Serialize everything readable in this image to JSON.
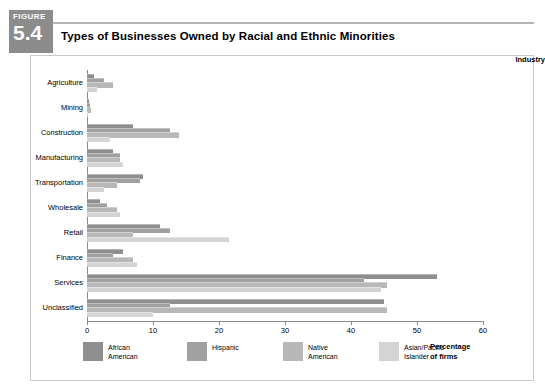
{
  "figure": {
    "word": "FIGURE",
    "number": "5.4",
    "badge_color": "#8c8c8c"
  },
  "title": "Types of Businesses Owned by Racial and Ethnic Minorities",
  "axis_header": "Industry",
  "xaxis_title_line1": "Percentage",
  "xaxis_title_line2": "of firms",
  "legend": [
    {
      "label_line1": "African",
      "label_line2": "American",
      "color": "#8e8e8e"
    },
    {
      "label_line1": "Hispanic",
      "label_line2": "",
      "color": "#a0a0a0"
    },
    {
      "label_line1": "Native",
      "label_line2": "American",
      "color": "#b8b8b8"
    },
    {
      "label_line1": "Asian/Pacific",
      "label_line2": "Islander",
      "color": "#d4d4d4"
    }
  ],
  "chart_data": {
    "type": "bar",
    "orientation": "horizontal",
    "title": "Types of Businesses Owned by Racial and Ethnic Minorities",
    "xlabel": "Percentage of firms",
    "ylabel": "Industry",
    "xlim": [
      0,
      60
    ],
    "xticks": [
      0,
      10,
      20,
      30,
      40,
      50,
      60
    ],
    "grid": false,
    "legend_position": "bottom",
    "categories": [
      "Agriculture",
      "Mining",
      "Construction",
      "Manufacturing",
      "Transportation",
      "Wholesale",
      "Retail",
      "Finance",
      "Services",
      "Unclassified"
    ],
    "series": [
      {
        "name": "African American",
        "color": "#8e8e8e",
        "values": [
          1.0,
          0.3,
          7.0,
          4.0,
          8.5,
          2.0,
          11.0,
          5.5,
          53.0,
          45.0
        ]
      },
      {
        "name": "Hispanic",
        "color": "#a0a0a0",
        "values": [
          2.5,
          0.4,
          12.5,
          5.0,
          8.0,
          3.0,
          12.5,
          4.0,
          42.0,
          12.5
        ]
      },
      {
        "name": "Native American",
        "color": "#b8b8b8",
        "values": [
          4.0,
          0.6,
          14.0,
          5.0,
          4.5,
          4.5,
          7.0,
          7.0,
          45.5,
          45.5
        ]
      },
      {
        "name": "Asian/Pacific Islander",
        "color": "#d4d4d4",
        "values": [
          1.5,
          0.2,
          3.5,
          5.5,
          2.5,
          5.0,
          21.5,
          7.5,
          44.5,
          10.0
        ]
      }
    ]
  }
}
